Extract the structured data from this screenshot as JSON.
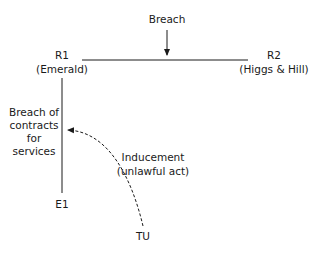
{
  "diagram": {
    "top_label": "Breach",
    "r1": {
      "name": "R1",
      "detail": "(Emerald)"
    },
    "r2": {
      "name": "R2",
      "detail": "(Higgs & Hill)"
    },
    "e1": {
      "name": "E1"
    },
    "tu": {
      "name": "TU"
    },
    "side_label": [
      "Breach of",
      "contracts",
      "for",
      "services"
    ],
    "inducement": [
      "Inducement",
      "(unlawful act)"
    ],
    "line_color": "#1a1a1a"
  }
}
